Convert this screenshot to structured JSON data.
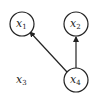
{
  "diagram": {
    "type": "directed-graph",
    "nodes": [
      {
        "id": "x1",
        "base": "x",
        "sub": "1",
        "cx": 22,
        "cy": 24
      },
      {
        "id": "x2",
        "base": "x",
        "sub": "2",
        "cx": 76,
        "cy": 24
      },
      {
        "id": "x3",
        "base": "x",
        "sub": "3",
        "cx": 22,
        "cy": 80
      },
      {
        "id": "x4",
        "base": "x",
        "sub": "4",
        "cx": 76,
        "cy": 80
      }
    ],
    "edges": [
      {
        "from": "x4",
        "to": "x1"
      },
      {
        "from": "x4",
        "to": "x2"
      }
    ],
    "colors": {
      "stroke": "#222222",
      "background": "#ffffff"
    }
  }
}
